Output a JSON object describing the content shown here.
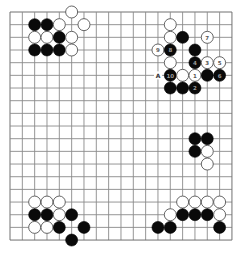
{
  "board": {
    "size": 19,
    "origin_x": 10,
    "origin_y": 12,
    "spacing_x": 12.33,
    "spacing_y": 12.67,
    "stone_radius": 6,
    "colors": {
      "background": "#ffffff",
      "grid": "#8a8a8a",
      "black": "#0a0a0a",
      "white": "#ffffff"
    }
  },
  "stones": [
    {
      "color": "white",
      "col": 5,
      "row": 0
    },
    {
      "color": "black",
      "col": 2,
      "row": 1
    },
    {
      "color": "black",
      "col": 3,
      "row": 1
    },
    {
      "color": "white",
      "col": 4,
      "row": 1
    },
    {
      "color": "white",
      "col": 6,
      "row": 1
    },
    {
      "color": "white",
      "col": 2,
      "row": 2
    },
    {
      "color": "white",
      "col": 3,
      "row": 2
    },
    {
      "color": "black",
      "col": 4,
      "row": 2
    },
    {
      "color": "white",
      "col": 5,
      "row": 2
    },
    {
      "color": "black",
      "col": 2,
      "row": 3
    },
    {
      "color": "black",
      "col": 3,
      "row": 3
    },
    {
      "color": "black",
      "col": 4,
      "row": 3
    },
    {
      "color": "white",
      "col": 5,
      "row": 3
    },
    {
      "color": "white",
      "col": 13,
      "row": 1
    },
    {
      "color": "white",
      "col": 13,
      "row": 2
    },
    {
      "color": "black",
      "col": 14,
      "row": 2
    },
    {
      "color": "white",
      "col": 16,
      "row": 2,
      "number": "7"
    },
    {
      "color": "white",
      "col": 12,
      "row": 3,
      "number": "9"
    },
    {
      "color": "black",
      "col": 13,
      "row": 3,
      "number": "8"
    },
    {
      "color": "black",
      "col": 15,
      "row": 3
    },
    {
      "color": "white",
      "col": 13,
      "row": 4
    },
    {
      "color": "black",
      "col": 15,
      "row": 4,
      "number": "4"
    },
    {
      "color": "white",
      "col": 16,
      "row": 4,
      "number": "3"
    },
    {
      "color": "white",
      "col": 17,
      "row": 4,
      "number": "5"
    },
    {
      "color": "black",
      "col": 13,
      "row": 5,
      "number": "10"
    },
    {
      "color": "white",
      "col": 14,
      "row": 5
    },
    {
      "color": "white",
      "col": 15,
      "row": 5,
      "number": "1"
    },
    {
      "color": "black",
      "col": 16,
      "row": 5
    },
    {
      "color": "black",
      "col": 17,
      "row": 5,
      "number": "6"
    },
    {
      "color": "black",
      "col": 13,
      "row": 6
    },
    {
      "color": "black",
      "col": 14,
      "row": 6
    },
    {
      "color": "black",
      "col": 15,
      "row": 6,
      "number": "2"
    },
    {
      "color": "black",
      "col": 15,
      "row": 10
    },
    {
      "color": "black",
      "col": 16,
      "row": 10
    },
    {
      "color": "black",
      "col": 15,
      "row": 11
    },
    {
      "color": "white",
      "col": 16,
      "row": 11
    },
    {
      "color": "white",
      "col": 16,
      "row": 12
    },
    {
      "color": "white",
      "col": 2,
      "row": 15
    },
    {
      "color": "white",
      "col": 3,
      "row": 15
    },
    {
      "color": "white",
      "col": 4,
      "row": 15
    },
    {
      "color": "black",
      "col": 2,
      "row": 16
    },
    {
      "color": "black",
      "col": 3,
      "row": 16
    },
    {
      "color": "white",
      "col": 4,
      "row": 16
    },
    {
      "color": "black",
      "col": 5,
      "row": 16
    },
    {
      "color": "white",
      "col": 2,
      "row": 17
    },
    {
      "color": "white",
      "col": 3,
      "row": 17
    },
    {
      "color": "black",
      "col": 4,
      "row": 17
    },
    {
      "color": "black",
      "col": 6,
      "row": 17
    },
    {
      "color": "black",
      "col": 5,
      "row": 18
    },
    {
      "color": "white",
      "col": 14,
      "row": 15
    },
    {
      "color": "white",
      "col": 15,
      "row": 15
    },
    {
      "color": "white",
      "col": 16,
      "row": 15
    },
    {
      "color": "white",
      "col": 17,
      "row": 15
    },
    {
      "color": "white",
      "col": 13,
      "row": 16
    },
    {
      "color": "black",
      "col": 14,
      "row": 16
    },
    {
      "color": "black",
      "col": 15,
      "row": 16
    },
    {
      "color": "black",
      "col": 16,
      "row": 16
    },
    {
      "color": "white",
      "col": 17,
      "row": 16
    },
    {
      "color": "black",
      "col": 12,
      "row": 17
    },
    {
      "color": "black",
      "col": 13,
      "row": 17
    },
    {
      "color": "black",
      "col": 17,
      "row": 17
    }
  ],
  "labels": [
    {
      "text": "A",
      "col": 12,
      "row": 5
    }
  ]
}
